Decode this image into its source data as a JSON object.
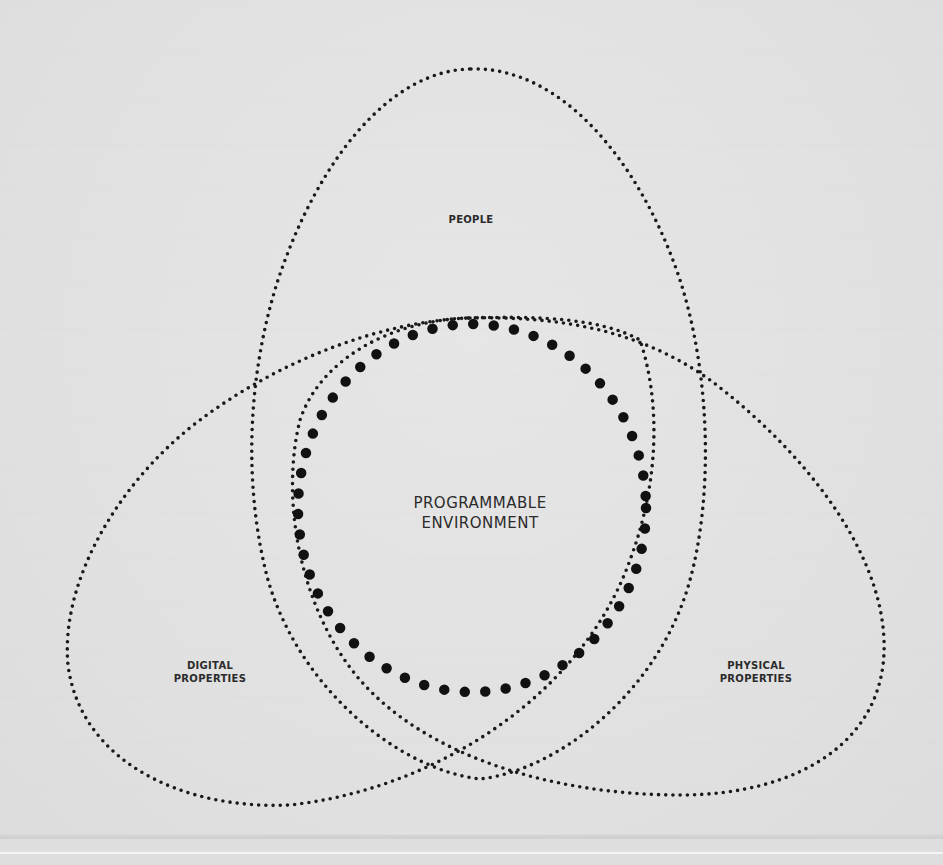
{
  "diagram": {
    "type": "venn",
    "sets": [
      {
        "id": "people",
        "label": "PEOPLE"
      },
      {
        "id": "digital",
        "label_line1": "DIGITAL",
        "label_line2": "PROPERTIES"
      },
      {
        "id": "physical",
        "label_line1": "PHYSICAL",
        "label_line2": "PROPERTIES"
      }
    ],
    "center": {
      "label_line1": "PROGRAMMABLE",
      "label_line2": "ENVIRONMENT"
    },
    "colors": {
      "background": "#e2e2e2",
      "dots": "#1a1a1a",
      "text": "#2b2b2b"
    }
  }
}
